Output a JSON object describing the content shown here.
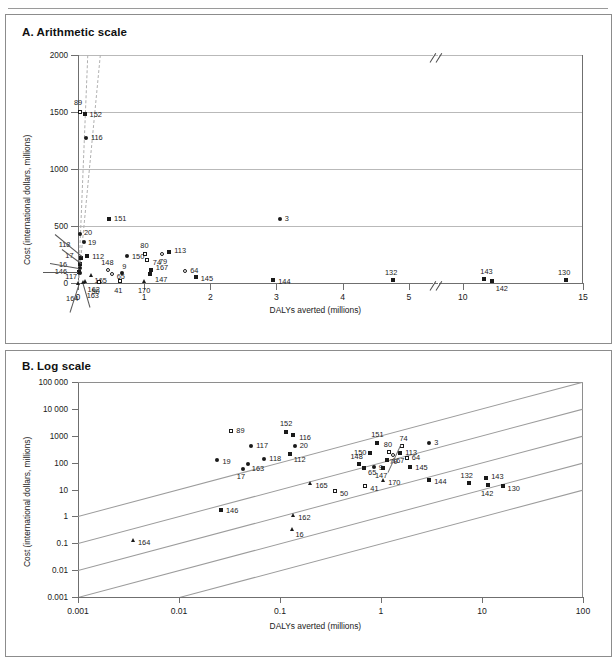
{
  "figure": {
    "panelA_title": "A. Arithmetic scale",
    "panelB_title": "B. Log scale"
  },
  "panelA": {
    "xlabel": "DALYs averted (millions)",
    "ylabel": "Cost (international dollars, millions)",
    "yticks": [
      "0",
      "500",
      "1000",
      "1500",
      "2000"
    ],
    "xticks": [
      "0",
      "1",
      "2",
      "3",
      "4",
      "5",
      "10",
      "15"
    ],
    "axis_break": true
  },
  "panelB": {
    "xlabel": "DALYs averted (millions)",
    "ylabel": "Cost (international dollars, millions)",
    "yticks": [
      "0.001",
      "0.01",
      "0.1",
      "1",
      "10",
      "100",
      "1000",
      "10 000",
      "100 000"
    ],
    "xticks": [
      "0.001",
      "0.01",
      "0.1",
      "1",
      "10",
      "100"
    ]
  },
  "chart_data": [
    {
      "type": "scatter",
      "panel": "A. Arithmetic scale",
      "title": "A. Arithmetic scale",
      "xlabel": "DALYs averted (millions)",
      "ylabel": "Cost (international dollars, millions)",
      "xlim": [
        0,
        15
      ],
      "ylim": [
        0,
        2000
      ],
      "xticks": [
        0,
        1,
        2,
        3,
        4,
        5,
        10,
        15
      ],
      "yticks": [
        0,
        500,
        1000,
        1500,
        2000
      ],
      "xaxis_break_between": [
        5,
        10
      ],
      "grid": "horizontal",
      "legend": "none",
      "marker_types": [
        "filled-square",
        "open-square",
        "filled-circle",
        "open-circle",
        "filled-triangle"
      ],
      "reference_lines": [
        {
          "style": "dashed",
          "from": [
            0,
            0
          ],
          "to": [
            0.14,
            2000
          ]
        },
        {
          "style": "dashed",
          "from": [
            0,
            0
          ],
          "to": [
            0.33,
            2000
          ]
        }
      ],
      "points": [
        {
          "label": "89",
          "x": 0.03,
          "y": 1500,
          "marker": "open-square"
        },
        {
          "label": "152",
          "x": 0.1,
          "y": 1480,
          "marker": "filled-square"
        },
        {
          "label": "116",
          "x": 0.12,
          "y": 1270,
          "marker": "filled-circle"
        },
        {
          "label": "151",
          "x": 0.47,
          "y": 560,
          "marker": "filled-square"
        },
        {
          "label": "3",
          "x": 3.05,
          "y": 560,
          "marker": "filled-circle"
        },
        {
          "label": "20",
          "x": 0.03,
          "y": 430,
          "marker": "filled-circle"
        },
        {
          "label": "19",
          "x": 0.09,
          "y": 360,
          "marker": "filled-circle"
        },
        {
          "label": "112",
          "x": 0.14,
          "y": 240,
          "marker": "filled-square"
        },
        {
          "label": "150",
          "x": 0.74,
          "y": 240,
          "marker": "filled-circle"
        },
        {
          "label": "80",
          "x": 1.02,
          "y": 255,
          "marker": "open-square"
        },
        {
          "label": "74",
          "x": 1.04,
          "y": 200,
          "marker": "open-square"
        },
        {
          "label": "79",
          "x": 1.27,
          "y": 255,
          "marker": "open-circle"
        },
        {
          "label": "113",
          "x": 1.38,
          "y": 270,
          "marker": "filled-square"
        },
        {
          "label": "118",
          "x": 0.04,
          "y": 215,
          "marker": "filled-square"
        },
        {
          "label": "17",
          "x": 0.035,
          "y": 165,
          "marker": "filled-square"
        },
        {
          "label": "16",
          "x": 0.03,
          "y": 130,
          "marker": "filled-circle"
        },
        {
          "label": "146",
          "x": 0.01,
          "y": 95,
          "marker": "filled-square"
        },
        {
          "label": "117",
          "x": 0.035,
          "y": 85,
          "marker": "filled-circle"
        },
        {
          "label": "165",
          "x": 0.19,
          "y": 70,
          "marker": "filled-triangle"
        },
        {
          "label": "148",
          "x": 0.46,
          "y": 110,
          "marker": "open-circle"
        },
        {
          "label": "65",
          "x": 0.51,
          "y": 75,
          "marker": "open-circle"
        },
        {
          "label": "9",
          "x": 0.67,
          "y": 90,
          "marker": "filled-circle"
        },
        {
          "label": "167",
          "x": 1.1,
          "y": 110,
          "marker": "filled-square"
        },
        {
          "label": "147",
          "x": 1.09,
          "y": 75,
          "marker": "filled-square"
        },
        {
          "label": "64",
          "x": 1.62,
          "y": 105,
          "marker": "open-circle"
        },
        {
          "label": "145",
          "x": 1.78,
          "y": 55,
          "marker": "filled-square"
        },
        {
          "label": "162",
          "x": 0.1,
          "y": 20,
          "marker": "filled-triangle"
        },
        {
          "label": "50",
          "x": 0.31,
          "y": 12,
          "marker": "open-square"
        },
        {
          "label": "41",
          "x": 0.64,
          "y": 15,
          "marker": "open-square"
        },
        {
          "label": "170",
          "x": 1.0,
          "y": 20,
          "marker": "filled-triangle"
        },
        {
          "label": "164",
          "x": 0.004,
          "y": 2,
          "marker": "filled-triangle"
        },
        {
          "label": "163",
          "x": 0.07,
          "y": 8,
          "marker": "filled-triangle"
        },
        {
          "label": "144",
          "x": 2.95,
          "y": 25,
          "marker": "filled-square"
        },
        {
          "label": "132",
          "x": 7.1,
          "y": 30,
          "marker": "filled-square"
        },
        {
          "label": "143",
          "x": 10.9,
          "y": 35,
          "marker": "filled-square"
        },
        {
          "label": "142",
          "x": 11.2,
          "y": 18,
          "marker": "filled-square"
        },
        {
          "label": "130",
          "x": 14.3,
          "y": 30,
          "marker": "filled-square"
        }
      ]
    },
    {
      "type": "scatter",
      "panel": "B. Log scale",
      "title": "B. Log scale",
      "xlabel": "DALYs averted (millions)",
      "ylabel": "Cost (international dollars, millions)",
      "xscale": "log",
      "yscale": "log",
      "xlim": [
        0.001,
        100
      ],
      "ylim": [
        0.001,
        100000
      ],
      "xticks": [
        0.001,
        0.01,
        0.1,
        1,
        10,
        100
      ],
      "yticks": [
        0.001,
        0.01,
        0.1,
        1,
        10,
        100,
        1000,
        10000,
        100000
      ],
      "grid": "diagonal-iso-cost",
      "legend": "none",
      "iso_lines_cost_per_daly": [
        0.1,
        1,
        10,
        100,
        1000
      ],
      "points": [
        {
          "label": "89",
          "x": 0.033,
          "y": 1500,
          "marker": "open-square"
        },
        {
          "label": "152",
          "x": 0.115,
          "y": 1400,
          "marker": "filled-square"
        },
        {
          "label": "116",
          "x": 0.135,
          "y": 1100,
          "marker": "filled-square"
        },
        {
          "label": "151",
          "x": 0.92,
          "y": 560,
          "marker": "filled-square"
        },
        {
          "label": "3",
          "x": 3.0,
          "y": 560,
          "marker": "filled-circle"
        },
        {
          "label": "117",
          "x": 0.052,
          "y": 430,
          "marker": "filled-circle"
        },
        {
          "label": "20",
          "x": 0.14,
          "y": 420,
          "marker": "filled-circle"
        },
        {
          "label": "74",
          "x": 1.6,
          "y": 430,
          "marker": "open-square"
        },
        {
          "label": "80",
          "x": 1.2,
          "y": 250,
          "marker": "open-square"
        },
        {
          "label": "113",
          "x": 1.55,
          "y": 230,
          "marker": "filled-square"
        },
        {
          "label": "79",
          "x": 1.3,
          "y": 190,
          "marker": "open-circle"
        },
        {
          "label": "150",
          "x": 0.78,
          "y": 230,
          "marker": "filled-square"
        },
        {
          "label": "112",
          "x": 0.125,
          "y": 210,
          "marker": "filled-square"
        },
        {
          "label": "118",
          "x": 0.07,
          "y": 140,
          "marker": "filled-circle"
        },
        {
          "label": "19",
          "x": 0.024,
          "y": 120,
          "marker": "filled-circle"
        },
        {
          "label": "163",
          "x": 0.048,
          "y": 90,
          "marker": "filled-circle"
        },
        {
          "label": "17",
          "x": 0.043,
          "y": 60,
          "marker": "filled-circle"
        },
        {
          "label": "64",
          "x": 1.8,
          "y": 150,
          "marker": "open-square"
        },
        {
          "label": "167",
          "x": 1.15,
          "y": 120,
          "marker": "filled-square"
        },
        {
          "label": "148",
          "x": 0.6,
          "y": 90,
          "marker": "filled-square"
        },
        {
          "label": "65",
          "x": 0.68,
          "y": 65,
          "marker": "filled-square"
        },
        {
          "label": "9",
          "x": 0.85,
          "y": 70,
          "marker": "filled-circle"
        },
        {
          "label": "147",
          "x": 1.05,
          "y": 62,
          "marker": "filled-square"
        },
        {
          "label": "145",
          "x": 1.95,
          "y": 70,
          "marker": "filled-square"
        },
        {
          "label": "170",
          "x": 1.05,
          "y": 22,
          "marker": "filled-triangle"
        },
        {
          "label": "165",
          "x": 0.2,
          "y": 18,
          "marker": "filled-triangle"
        },
        {
          "label": "41",
          "x": 0.7,
          "y": 14,
          "marker": "open-square"
        },
        {
          "label": "50",
          "x": 0.35,
          "y": 9,
          "marker": "open-square"
        },
        {
          "label": "144",
          "x": 3.0,
          "y": 22,
          "marker": "filled-square"
        },
        {
          "label": "132",
          "x": 7.4,
          "y": 18,
          "marker": "filled-square"
        },
        {
          "label": "143",
          "x": 11.0,
          "y": 26,
          "marker": "filled-square"
        },
        {
          "label": "142",
          "x": 11.5,
          "y": 15,
          "marker": "filled-square"
        },
        {
          "label": "130",
          "x": 16.0,
          "y": 13,
          "marker": "filled-square"
        },
        {
          "label": "146",
          "x": 0.026,
          "y": 1.8,
          "marker": "filled-square"
        },
        {
          "label": "162",
          "x": 0.135,
          "y": 1.1,
          "marker": "filled-triangle"
        },
        {
          "label": "16",
          "x": 0.13,
          "y": 0.33,
          "marker": "filled-triangle"
        },
        {
          "label": "164",
          "x": 0.0035,
          "y": 0.13,
          "marker": "filled-triangle"
        }
      ]
    }
  ]
}
